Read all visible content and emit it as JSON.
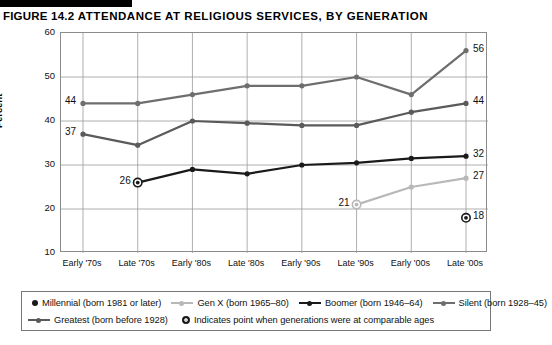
{
  "header": {
    "figure_number": "FIGURE 14.2",
    "title": "ATTENDANCE AT RELIGIOUS SERVICES, BY GENERATION"
  },
  "legend": {
    "items": [
      {
        "label": "Millennial (born 1981 or later)",
        "marker": "dot",
        "color": "#1a1a1a"
      },
      {
        "label": "Gen X (born 1965–80)",
        "marker": "line-dot",
        "color": "#b8b8b8"
      },
      {
        "label": "Boomer (born 1946–64)",
        "marker": "line-dot",
        "color": "#1a1a1a"
      },
      {
        "label": "Silent (born 1928–45)",
        "marker": "line-dot",
        "color": "#6e6e6e"
      },
      {
        "label": "Greatest (born before 1928)",
        "marker": "line-dot",
        "color": "#5a5a5a"
      },
      {
        "label": "Indicates point when generations were at comparable ages",
        "marker": "ring-dot",
        "color": "#1a1a1a"
      }
    ]
  },
  "chart_data": {
    "type": "line",
    "title": "ATTENDANCE AT RELIGIOUS SERVICES, BY GENERATION",
    "xlabel": "",
    "ylabel": "Percent",
    "ylim": [
      10,
      60
    ],
    "yticks": [
      10,
      20,
      30,
      40,
      50,
      60
    ],
    "grid": true,
    "legend_position": "bottom",
    "categories": [
      "Early '70s",
      "Late '70s",
      "Early '80s",
      "Late '80s",
      "Early '90s",
      "Late '90s",
      "Early '00s",
      "Late '00s"
    ],
    "series": [
      {
        "name": "Silent (born 1928–45)",
        "color": "#6e6e6e",
        "values": [
          44,
          44,
          46,
          48,
          48,
          50,
          46,
          56
        ],
        "labels": {
          "0": "44",
          "7": "56"
        }
      },
      {
        "name": "Greatest (born before 1928)",
        "color": "#5a5a5a",
        "values": [
          37,
          34.5,
          40,
          39.5,
          39,
          39,
          42,
          44
        ],
        "labels": {
          "0": "37",
          "7": "44"
        }
      },
      {
        "name": "Boomer (born 1946–64)",
        "color": "#1a1a1a",
        "values": [
          null,
          26,
          29,
          28,
          30,
          30.5,
          31.5,
          32
        ],
        "labels": {
          "1": "26",
          "7": "32"
        }
      },
      {
        "name": "Gen X (born 1965–80)",
        "color": "#b8b8b8",
        "values": [
          null,
          null,
          null,
          null,
          null,
          21,
          25,
          27
        ],
        "labels": {
          "5": "21",
          "7": "27"
        }
      },
      {
        "name": "Millennial (born 1981 or later)",
        "color": "#1a1a1a",
        "values": [
          null,
          null,
          null,
          null,
          null,
          null,
          null,
          18
        ],
        "labels": {
          "7": "18"
        }
      }
    ],
    "comparable_age_points": [
      {
        "series": "Boomer (born 1946–64)",
        "category": "Late '70s",
        "value": 26
      },
      {
        "series": "Gen X (born 1965–80)",
        "category": "Late '90s",
        "value": 21
      },
      {
        "series": "Millennial (born 1981 or later)",
        "category": "Late '00s",
        "value": 18
      }
    ]
  }
}
